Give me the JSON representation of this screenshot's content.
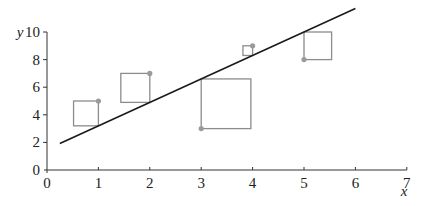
{
  "chart_data": {
    "type": "scatter",
    "title": "",
    "xlabel": "x",
    "ylabel": "y",
    "xlim": [
      0,
      7
    ],
    "ylim": [
      0,
      10
    ],
    "x_ticks": [
      "0",
      "1",
      "2",
      "3",
      "4",
      "5",
      "6",
      "7"
    ],
    "y_ticks": [
      "0",
      "2",
      "4",
      "6",
      "8",
      "10"
    ],
    "grid": false,
    "legend": null,
    "points": [
      {
        "x": 1,
        "y": 5
      },
      {
        "x": 2,
        "y": 7
      },
      {
        "x": 3,
        "y": 3
      },
      {
        "x": 4,
        "y": 9
      },
      {
        "x": 5,
        "y": 8
      }
    ],
    "regression_line": {
      "slope": 1.7,
      "intercept": 1.5,
      "x_start": 0.25,
      "x_end": 6.0
    },
    "annotations": "Squares drawn from each point to the regression line, side length equal to the residual (squared residuals)",
    "colors": {
      "line": "#1a1a1a",
      "points": "#9a9a9a",
      "squares": "#8c8c8c",
      "axes": "#333333"
    }
  }
}
